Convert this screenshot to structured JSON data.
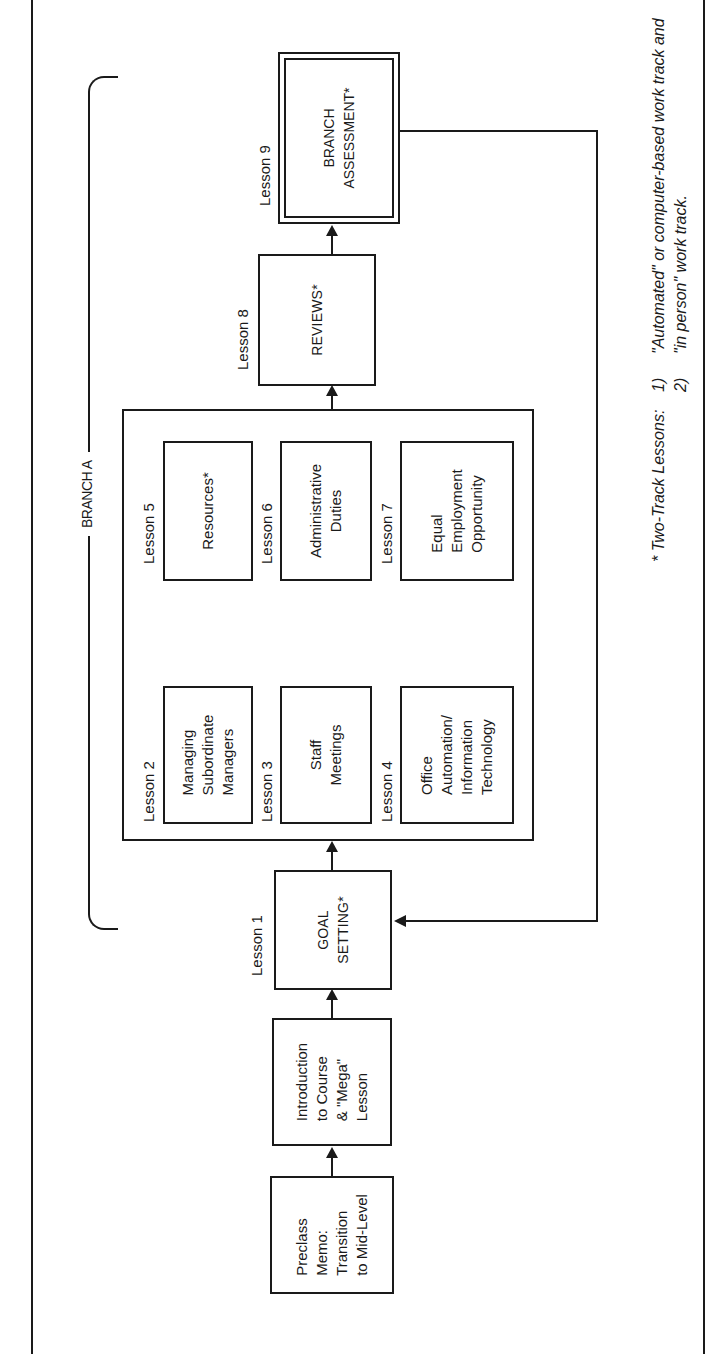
{
  "diagram": {
    "branch_label": "BRANCH A",
    "nodes": [
      {
        "id": "preclass",
        "lesson": "",
        "text": "Preclass\nMemo:\nTransition\nto Mid-Level"
      },
      {
        "id": "intro",
        "lesson": "",
        "text": "Introduction\nto Course\n& \"Mega\"\nLesson"
      },
      {
        "id": "lesson1",
        "lesson": "Lesson 1",
        "text": "GOAL\nSETTING*"
      },
      {
        "id": "lesson2",
        "lesson": "Lesson 2",
        "text": "Managing\nSubordinate\nManagers"
      },
      {
        "id": "lesson3",
        "lesson": "Lesson 3",
        "text": "Staff\nMeetings"
      },
      {
        "id": "lesson4",
        "lesson": "Lesson 4",
        "text": "Office\nAutomation/\nInformation\nTechnology"
      },
      {
        "id": "lesson5",
        "lesson": "Lesson 5",
        "text": "Resources*"
      },
      {
        "id": "lesson6",
        "lesson": "Lesson 6",
        "text": "Administrative\nDuties"
      },
      {
        "id": "lesson7",
        "lesson": "Lesson 7",
        "text": "Equal\nEmployment\nOpportunity"
      },
      {
        "id": "lesson8",
        "lesson": "Lesson 8",
        "text": "REVIEWS*"
      },
      {
        "id": "lesson9",
        "lesson": "Lesson 9",
        "text": "BRANCH\nASSESSMENT*"
      }
    ],
    "edges": [
      {
        "from": "preclass",
        "to": "intro"
      },
      {
        "from": "intro",
        "to": "lesson1"
      },
      {
        "from": "lesson1",
        "to": "lessons2-7-group"
      },
      {
        "from": "lessons2-7-group",
        "to": "lesson8"
      },
      {
        "from": "lesson8",
        "to": "lesson9"
      },
      {
        "from": "lesson9",
        "to": "lesson1",
        "type": "loop-back"
      }
    ]
  },
  "footnote": {
    "marker": "* Two-Track Lessons:",
    "items": [
      {
        "num": "1)",
        "text": "\"Automated\" or computer-based work track and"
      },
      {
        "num": "2)",
        "text": "\"in person\" work track."
      }
    ]
  }
}
